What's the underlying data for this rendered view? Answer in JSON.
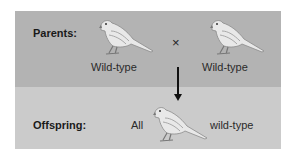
{
  "parents": {
    "label": "Parents:",
    "left_label": "Wild-type",
    "right_label": "Wild-type",
    "cross_symbol": "×"
  },
  "offspring": {
    "label": "Offspring:",
    "prefix": "All",
    "suffix": "wild-type"
  },
  "colors": {
    "top_panel": "#b3b3b3",
    "bottom_panel": "#cbcbcb",
    "arrow": "#111111"
  }
}
